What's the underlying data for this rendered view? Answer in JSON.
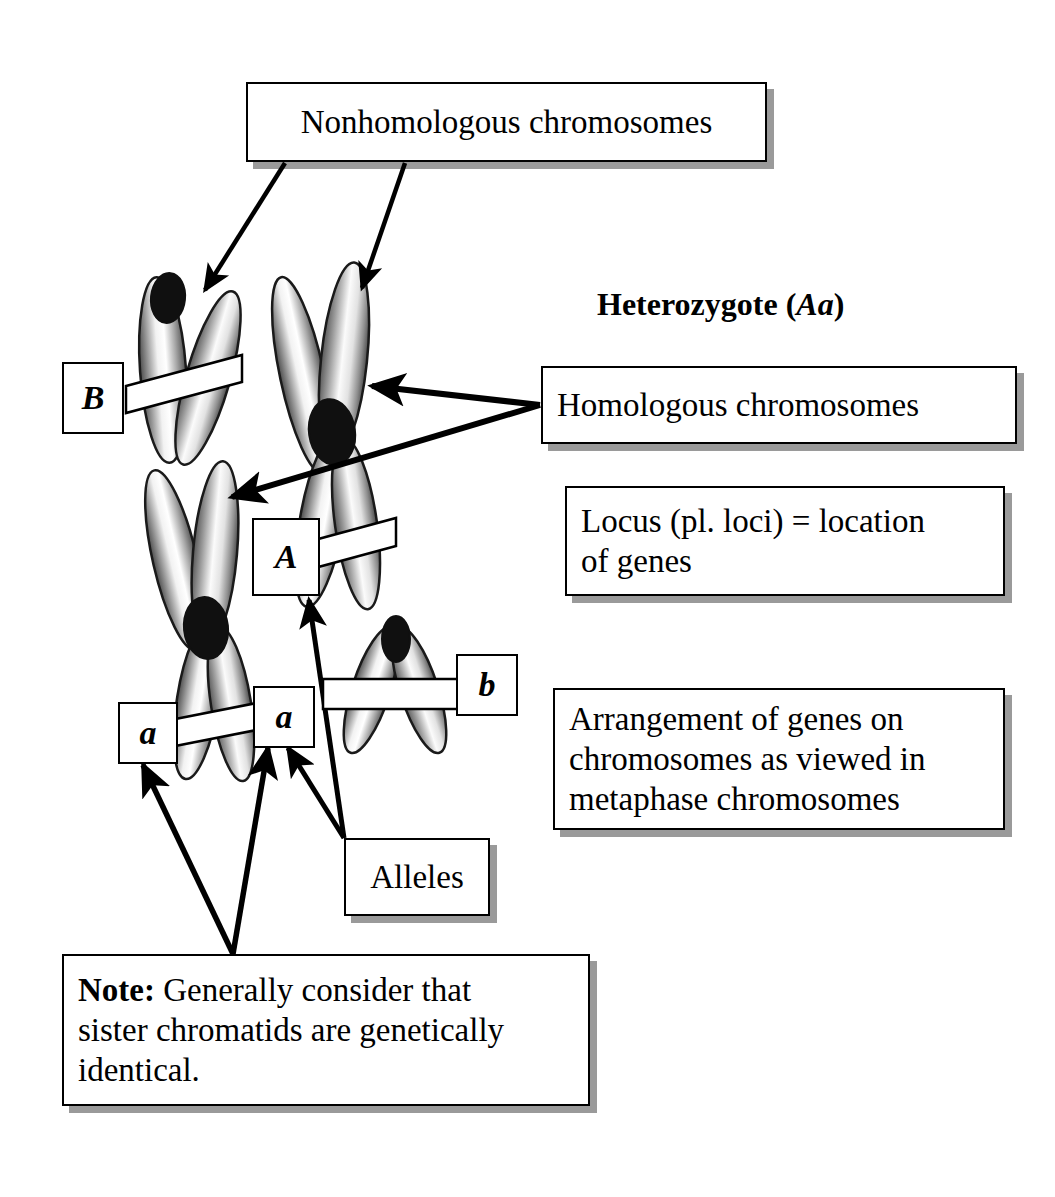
{
  "figure": {
    "background": "#ffffff",
    "ink": "#000000",
    "shadow_color": "#9a9a9a"
  },
  "heading": {
    "text_plain": "Heterozygote (Aa)",
    "lead": "Heterozygote (",
    "italic": "Aa",
    "tail": ")"
  },
  "callouts": [
    {
      "id": "nonhomologous",
      "name": "nonhomologous-chromosomes-box",
      "text": "Nonhomologous chromosomes",
      "align": "center"
    },
    {
      "id": "homologous",
      "name": "homologous-chromosomes-box",
      "text": "Homologous chromosomes",
      "align": "left"
    },
    {
      "id": "locus",
      "name": "locus-definition-box",
      "text": "Locus (pl. loci) = location\n of genes",
      "align": "left"
    },
    {
      "id": "arrangement",
      "name": "gene-arrangement-box",
      "text": "Arrangement of genes on\nchromosomes as viewed in\nmetaphase chromosomes",
      "align": "left"
    },
    {
      "id": "alleles",
      "name": "alleles-box",
      "text": "Alleles",
      "align": "center"
    }
  ],
  "note_box": {
    "name": "note-box",
    "bold_lead": "Note:",
    "body": " Generally consider that\nsister chromatids are genetically\nidentical."
  },
  "allele_labels": [
    {
      "id": "B",
      "name": "allele-label-B",
      "text": "B"
    },
    {
      "id": "A",
      "name": "allele-label-A",
      "text": "A"
    },
    {
      "id": "a-left",
      "name": "allele-label-a-left",
      "text": "a"
    },
    {
      "id": "a-right",
      "name": "allele-label-a-right",
      "text": "a"
    },
    {
      "id": "b",
      "name": "allele-label-b",
      "text": "b"
    }
  ],
  "chromosomes": [
    {
      "id": "B-chrom",
      "name": "chromosome-B",
      "allele": "B",
      "shape": "acrocentric-V",
      "centromere": "top"
    },
    {
      "id": "A-chrom",
      "name": "chromosome-A",
      "allele": "A",
      "shape": "metacentric-X",
      "centromere": "middle"
    },
    {
      "id": "a-chrom",
      "name": "chromosome-a",
      "allele": "a",
      "shape": "metacentric-X",
      "centromere": "middle"
    },
    {
      "id": "b-chrom",
      "name": "chromosome-b",
      "allele": "b",
      "shape": "acrocentric-V",
      "centromere": "top"
    }
  ],
  "arrow_groups": [
    {
      "from": "nonhomologous",
      "to": [
        "chromosome-B",
        "chromosome-A"
      ]
    },
    {
      "from": "homologous",
      "to": [
        "chromosome-A",
        "chromosome-a"
      ]
    },
    {
      "from": "alleles",
      "to": [
        "allele-label-A",
        "allele-label-a-right"
      ]
    },
    {
      "from": "note-box",
      "to": [
        "allele-label-a-left",
        "allele-label-a-right"
      ]
    }
  ]
}
